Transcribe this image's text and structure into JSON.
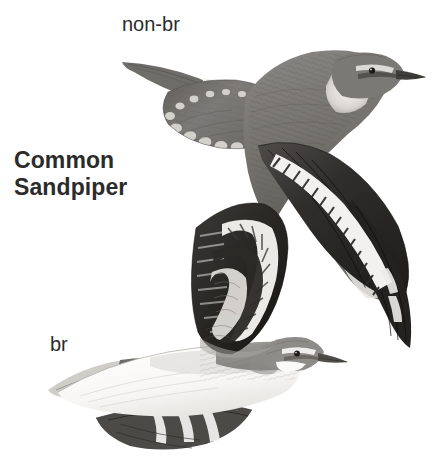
{
  "plate": {
    "width": 434,
    "height": 461,
    "background_color": "#ffffff",
    "kind": "field-guide-illustration-plate"
  },
  "species": {
    "common_name": "Common Sandpiper",
    "name_line_1": "Common",
    "name_line_2": "Sandpiper",
    "text_color": "#2b2b2b"
  },
  "labels": {
    "non_breeding": "non-br",
    "breeding": "br",
    "text_color": "#2b2b2b"
  },
  "illustrations": [
    {
      "id": "bird-nonbr",
      "name": "common-sandpiper-non-breeding-in-flight",
      "plumage": "non-breeding",
      "label": "non-br",
      "pose": "flying, upperwing view, head to the right, far wing raised, near wing lowered",
      "bounds": {
        "x": 118,
        "y": 40,
        "width": 308,
        "height": 260
      },
      "colors": {
        "upperparts": "#7d7b78",
        "upperparts_dark": "#5c5a57",
        "flight_feathers": "#2a2927",
        "wingbar": "#f4f3f1",
        "underparts": "#e8e6e3",
        "bill": "#4a4845",
        "eye": "#1d1c1b"
      }
    },
    {
      "id": "bird-br",
      "name": "common-sandpiper-breeding-in-flight",
      "plumage": "breeding",
      "label": "br",
      "pose": "flying, underwing view, head to the right, near wing raised high",
      "bounds": {
        "x": 46,
        "y": 198,
        "width": 276,
        "height": 254
      },
      "colors": {
        "upperparts": "#8d8b87",
        "underparts": "#fbfbfa",
        "underwing_dark": "#2e2d2b",
        "underwing_band": "#f2f1ef",
        "coverts": "#b9b7b3",
        "bill": "#57554f",
        "eye": "#1d1c1b"
      }
    }
  ]
}
